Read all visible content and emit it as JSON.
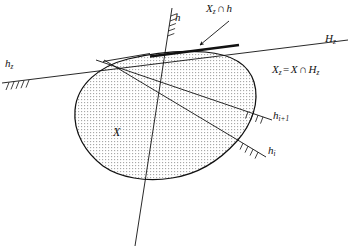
{
  "figure": {
    "domain": "geometry-diagram",
    "background_color": "#ffffff",
    "ink_color": "#111111",
    "fill_color": "#e9e9e9",
    "width": 351,
    "height": 252
  },
  "labels": {
    "h": {
      "base": "h",
      "sub": "",
      "op": ""
    },
    "xz_cap_h": {
      "base": "X",
      "sub": "z",
      "op": "∩",
      "tail": "h"
    },
    "Hz": {
      "base": "H",
      "sub": "z"
    },
    "hz": {
      "base": "h",
      "sub": "z"
    },
    "equation": {
      "lhs_base": "X",
      "lhs_sub": "z",
      "eq": "=",
      "rhs_base": "X",
      "op": "∩",
      "rhs2_base": "H",
      "rhs2_sub": "z"
    },
    "h_i_plus_1": {
      "base": "h",
      "sub": "i+1"
    },
    "h_i": {
      "base": "h",
      "sub": "i"
    },
    "X": {
      "base": "X"
    }
  },
  "geometry": {
    "body_outline_label": "X",
    "lines": [
      {
        "name": "hz-line",
        "label": "h_z",
        "from": [
          2,
          83
        ],
        "to": [
          348,
          40
        ]
      },
      {
        "name": "h-line",
        "label": "h",
        "from": [
          172,
          8
        ],
        "to": [
          135,
          246
        ]
      },
      {
        "name": "hi1-line",
        "label": "h_{i+1}",
        "from": [
          96,
          60
        ],
        "to": [
          272,
          120
        ]
      },
      {
        "name": "hi-line",
        "label": "h_i",
        "from": [
          104,
          60
        ],
        "to": [
          266,
          157
        ]
      },
      {
        "name": "tangent-stub",
        "from": [
          104,
          61
        ],
        "to": [
          148,
          54
        ]
      }
    ],
    "bold_segment": {
      "name": "Xz-cap-h",
      "from": [
        150,
        56
      ],
      "to": [
        238,
        45
      ]
    },
    "arrow": {
      "from": [
        228,
        22
      ],
      "to": [
        199,
        46
      ]
    },
    "hatch_groups": [
      {
        "on": "hz-line",
        "at_x": 14,
        "count": 5
      },
      {
        "on": "h-line",
        "at_y": 20,
        "count": 5
      },
      {
        "on": "hi1-line",
        "at_x": 255,
        "count": 4
      },
      {
        "on": "hi-line",
        "at_x": 250,
        "count": 4
      }
    ]
  }
}
